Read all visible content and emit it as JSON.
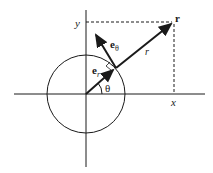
{
  "diagram": {
    "labels": {
      "x_axis": "x",
      "y_axis": "y",
      "point": "r",
      "radius": "r",
      "angle": "θ",
      "e_r_base": "e",
      "e_r_sub": "r",
      "e_theta_base": "e",
      "e_theta_sub": "θ"
    },
    "elements": [
      "horizontal axis",
      "vertical axis",
      "unit circle centered at origin",
      "position vector r from origin",
      "unit vector e_r along r",
      "unit vector e_θ perpendicular to r",
      "dashed projection lines to x and y",
      "right-angle marker between e_r and e_θ",
      "angle arc θ"
    ],
    "colors": {
      "stroke": "#1a1a1a",
      "background": "#ffffff"
    }
  }
}
